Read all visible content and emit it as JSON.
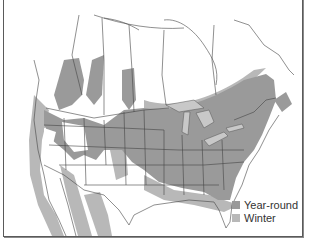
{
  "caption": {
    "text": "or bushes, sheltered in thickly dry... or other locations."
  },
  "map": {
    "region": "North America (Canada, United States, Mexico)",
    "colors": {
      "year_round": "#9a9a9a",
      "winter": "#b8b8b8",
      "land": "#ffffff",
      "borders": "#444444",
      "lakes": "#c8c8c8"
    }
  },
  "legend": {
    "items": [
      {
        "label": "Year-round",
        "color": "#9a9a9a"
      },
      {
        "label": "Winter",
        "color": "#b8b8b8"
      }
    ]
  }
}
